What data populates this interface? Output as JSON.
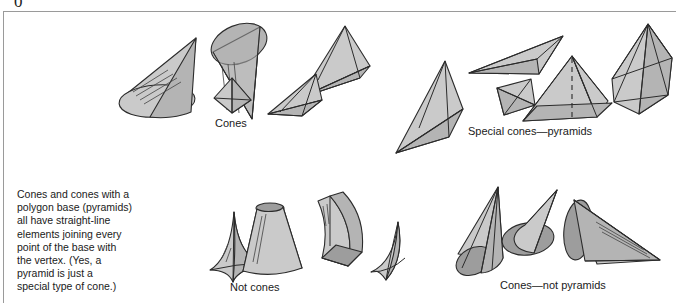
{
  "figure": {
    "corner_glyph": "0",
    "background_color": "#ffffff",
    "border_color": "#9a9a9a",
    "shape_fill_light": "#c9c9c9",
    "shape_fill_mid": "#b3b3b3",
    "shape_fill_dark": "#9c9c9c",
    "shape_stroke": "#2b2b2b",
    "text_color": "#1a1a1a"
  },
  "captions": {
    "cones": "Cones",
    "special_cones": "Special cones—pyramids",
    "not_cones": "Not cones",
    "cones_not_pyramids": "Cones—not pyramids"
  },
  "body_text": {
    "lines": [
      "Cones and cones with a",
      "polygon base (pyramids)",
      "all have straight-line",
      "elements joining every",
      "point of the base with",
      "the vertex. (Yes, a",
      "pyramid is just a",
      "special type of cone.)"
    ]
  },
  "groups": [
    {
      "id": "cones",
      "label": "Cones",
      "shapes": [
        "oblique-circular-cone-left",
        "circular-cone-upright",
        "triangular-pyramid-flat",
        "small-square-pyramid",
        "oblique-square-pyramid"
      ]
    },
    {
      "id": "special-cones-pyramids",
      "label": "Special cones—pyramids",
      "shapes": [
        "triangular-pyramid-tilted",
        "long-thin-pyramid",
        "small-octahedral-pyramid",
        "square-pyramid-with-axis",
        "hexagonal-pyramid"
      ]
    },
    {
      "id": "not-cones",
      "label": "Not cones",
      "shapes": [
        "concave-spike-shape",
        "truncated-cone-frustum",
        "curved-dome-box",
        "curved-saddle-shape"
      ]
    },
    {
      "id": "cones-not-pyramids",
      "label": "Cones—not pyramids",
      "shapes": [
        "elliptical-cone-upright",
        "circular-cone-pointing-right",
        "circular-cone-pointing-down-right"
      ]
    }
  ]
}
